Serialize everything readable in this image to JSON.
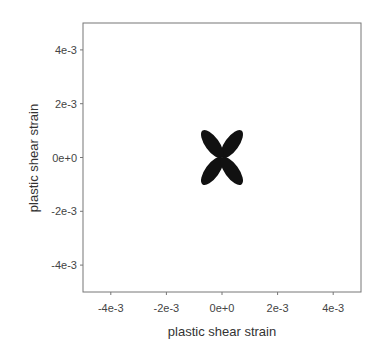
{
  "chart_data": {
    "type": "scatter",
    "title": "",
    "xlabel": "plastic shear strain",
    "ylabel": "plastic shear strain",
    "xlim": [
      -0.005,
      0.005
    ],
    "ylim": [
      -0.005,
      0.005
    ],
    "x_ticks": [
      -0.004,
      -0.002,
      0,
      0.002,
      0.004
    ],
    "x_tick_labels": [
      "-4e-3",
      "-2e-3",
      "0e+0",
      "2e-3",
      "4e-3"
    ],
    "y_ticks": [
      -0.004,
      -0.002,
      0,
      0.002,
      0.004
    ],
    "y_tick_labels": [
      "-4e-3",
      "-2e-3",
      "0e+0",
      "2e-3",
      "4e-3"
    ],
    "grid": false,
    "legend": null,
    "series": [
      {
        "name": "four-leaf yield locus",
        "shape": "four-petal rose (dense points)",
        "center": [
          0,
          0
        ],
        "petal_directions_deg": [
          45,
          135,
          225,
          315
        ],
        "petal_extent_x": 0.0007,
        "petal_extent_y": 0.001,
        "color": "#111111"
      }
    ]
  }
}
